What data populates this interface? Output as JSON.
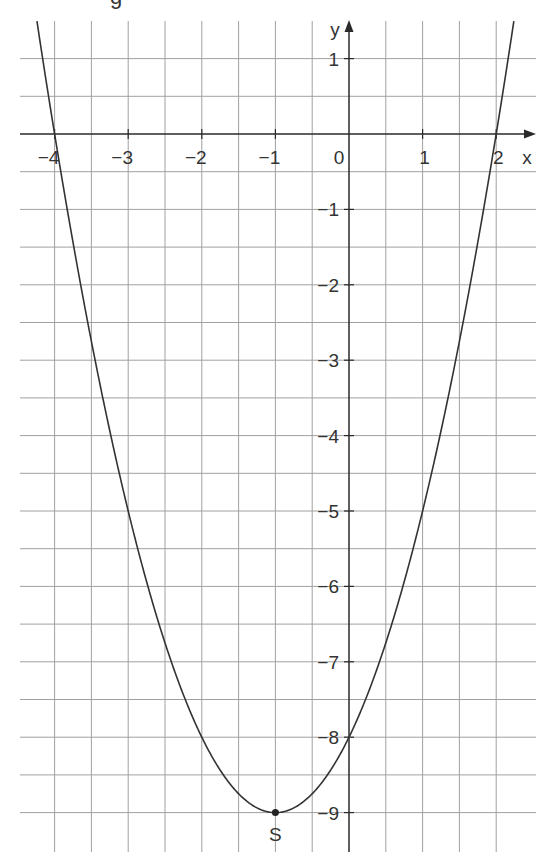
{
  "header_fragment": "g",
  "chart_data": {
    "type": "line",
    "title": "",
    "function": "y = (x + 1)^2 - 9",
    "xlabel": "x",
    "ylabel": "y",
    "xlim": [
      -4.5,
      2.5
    ],
    "ylim": [
      -9.5,
      1.5
    ],
    "grid": true,
    "grid_step": 0.5,
    "x_ticks": [
      -4,
      -3,
      -2,
      -1,
      0,
      1,
      2
    ],
    "x_tick_labels": [
      "−4",
      "−3",
      "−2",
      "−1",
      "0",
      "1",
      "2"
    ],
    "y_ticks": [
      1,
      -1,
      -2,
      -3,
      -4,
      -5,
      -6,
      -7,
      -8,
      -9
    ],
    "y_tick_labels": [
      "1",
      "−1",
      "−2",
      "−3",
      "−4",
      "−5",
      "−6",
      "−7",
      "−8",
      "−9"
    ],
    "series": [
      {
        "name": "parabola",
        "x": [
          -4.24,
          -4,
          -3.5,
          -3,
          -2.5,
          -2,
          -1.5,
          -1,
          -0.5,
          0,
          0.5,
          1,
          1.5,
          2,
          2.24
        ],
        "y": [
          1.5,
          0,
          -2.75,
          -5,
          -6.75,
          -8,
          -8.75,
          -9,
          -8.75,
          -8,
          -6.75,
          -5,
          -2.75,
          0,
          1.5
        ]
      }
    ],
    "annotations": [
      {
        "label": "S",
        "x": -1,
        "y": -9,
        "description": "vertex"
      }
    ],
    "roots": [
      -4,
      2
    ],
    "y_intercept": -8
  }
}
